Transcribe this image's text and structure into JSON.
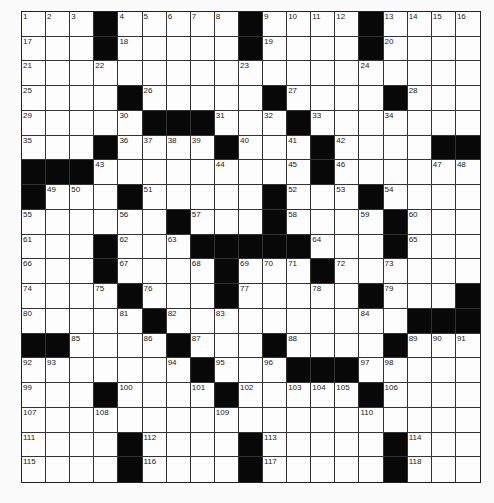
{
  "puzzle": {
    "rows": 19,
    "cols": 19,
    "colors": {
      "black": "#080808",
      "white": "#fdfdfd",
      "line": "#333333"
    },
    "grid": [
      "1 2 3 # 4 5 6 7 8 # 9 10 11 12 # 13 14 15 16",
      "17 . . # 18 . . . . # 19 . . . # 20 . . .",
      "21 . . 22 . . . . . 23 . . . . 24 . . . .",
      "25 . . . # 26 . . . . # 27 . . . # 28 . .",
      "29 . . . 30 # # # 31 . 32 # 33 . . 34 . . .",
      "35 . . # 36 37 38 39 # 40 . 41 # 42 . . . # #",
      "# # # 43 . . . . 44 . . 45 # 46 . . . 47 48",
      "# 49 50 . # 51 . . . . # 52 . 53 # 54 . . .",
      "55 . . . 56 . # 57 . . # 58 . . 59 # 60 . .",
      "61 . . # 62 . 63 # # # # # 64 . . # 65 . .",
      "66 . . # 67 . . 68 # 69 70 71 # 72 . 73 . . .",
      "74 . . 75 # 76 . . # 77 . . 78 . # 79 . . #",
      "80 . . . 81 # 82 . 83 . . . . . 84 . # # #",
      "# # 85 . . 86 # 87 . . # 88 . . . # 89 90 91",
      "92 93 . . . . 94 # 95 . 96 # # # 97 98 . . .",
      "99 . . # 100 . . 101 # 102 . 103 104 105 # 106 . . .",
      "107 . . 108 . . . . 109 . . . . . 110 . . . .",
      "111 . . . # 112 . . . # 113 . . . . # 114 . .",
      "115 . . . # 116 . . . # 117 . . . . # 118 . ."
    ]
  }
}
